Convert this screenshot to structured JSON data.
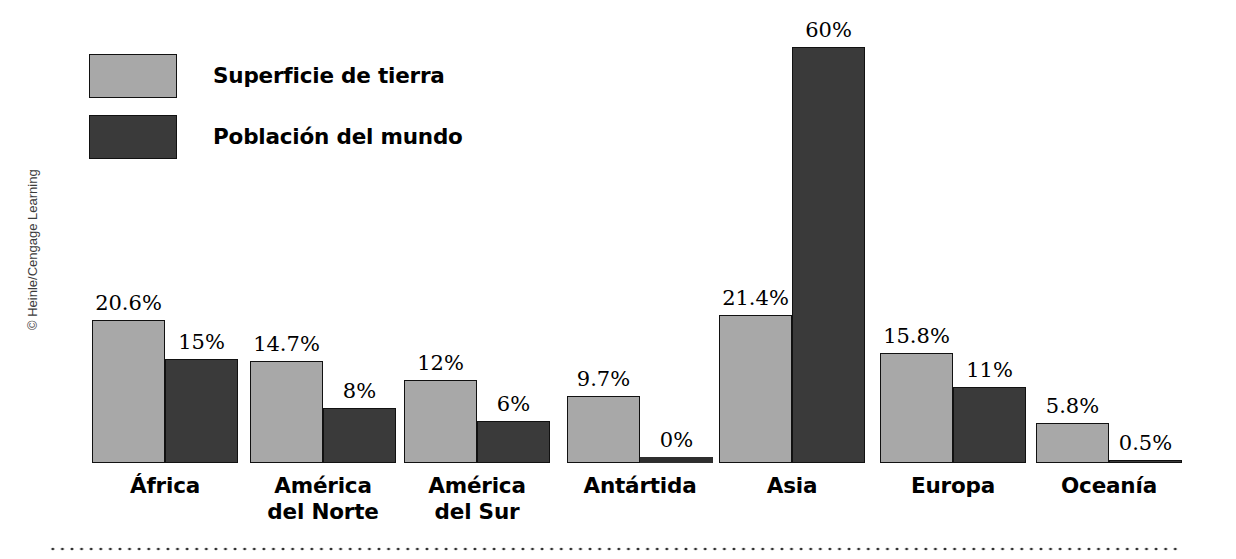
{
  "credit": "© Heinle/Cengage Learning",
  "legend": {
    "items": [
      {
        "label": "Superficie de tierra",
        "swatch": "light",
        "color": "#a8a8a8"
      },
      {
        "label": "Población del mundo",
        "swatch": "dark",
        "color": "#3a3a3a"
      }
    ]
  },
  "chart_data": {
    "type": "bar",
    "title": "",
    "xlabel": "",
    "ylabel": "",
    "ylim": [
      0,
      60
    ],
    "grid": false,
    "legend_position": "top-left",
    "categories": [
      "África",
      "América\ndel Norte",
      "América\ndel Sur",
      "Antártida",
      "Asia",
      "Europa",
      "Oceanía"
    ],
    "series": [
      {
        "name": "Superficie de tierra",
        "color": "#a8a8a8",
        "values": [
          20.6,
          14.7,
          12,
          9.7,
          21.4,
          15.8,
          5.8
        ],
        "labels": [
          "20.6%",
          "14.7%",
          "12%",
          "9.7%",
          "21.4%",
          "15.8%",
          "5.8%"
        ]
      },
      {
        "name": "Población del mundo",
        "color": "#3a3a3a",
        "values": [
          15,
          8,
          6,
          0,
          60,
          11,
          0.5
        ],
        "labels": [
          "15%",
          "8%",
          "6%",
          "0%",
          "60%",
          "11%",
          "0.5%"
        ]
      }
    ]
  },
  "footer": {
    "rule": "dotted-divider"
  }
}
